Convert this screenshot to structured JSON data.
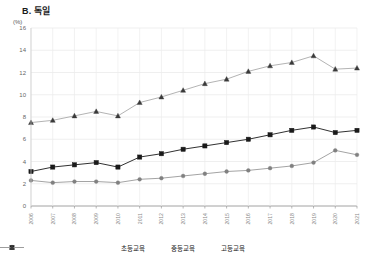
{
  "chart_data": {
    "type": "line",
    "title": "B. 독일",
    "xlabel": "",
    "ylabel": "(%)",
    "ylim": [
      0,
      16
    ],
    "yticks": [
      0,
      2,
      4,
      6,
      8,
      10,
      12,
      14,
      16
    ],
    "grid": true,
    "legend_position": "bottom",
    "categories": [
      "2006",
      "2007",
      "2008",
      "2009",
      "2010",
      "2011",
      "2012",
      "2013",
      "2014",
      "2015",
      "2016",
      "2017",
      "2018",
      "2019",
      "2020",
      "2021"
    ],
    "series": [
      {
        "name": "초등교육",
        "marker": "circle",
        "color": "#999999",
        "values": [
          2.3,
          2.1,
          2.2,
          2.2,
          2.1,
          2.4,
          2.5,
          2.7,
          2.9,
          3.1,
          3.2,
          3.4,
          3.6,
          3.9,
          5.0,
          4.6
        ]
      },
      {
        "name": "중등교육",
        "marker": "square",
        "color": "#1a1a1a",
        "values": [
          3.1,
          3.5,
          3.7,
          3.9,
          3.5,
          4.4,
          4.7,
          5.1,
          5.4,
          5.7,
          6.0,
          6.4,
          6.8,
          7.1,
          6.6,
          6.8
        ]
      },
      {
        "name": "고등교육",
        "marker": "triangle",
        "color": "#aaaaaa",
        "values": [
          7.5,
          7.7,
          8.1,
          8.5,
          8.1,
          9.3,
          9.8,
          10.4,
          11.0,
          11.4,
          12.1,
          12.6,
          12.9,
          13.5,
          12.3,
          12.4
        ]
      }
    ]
  }
}
